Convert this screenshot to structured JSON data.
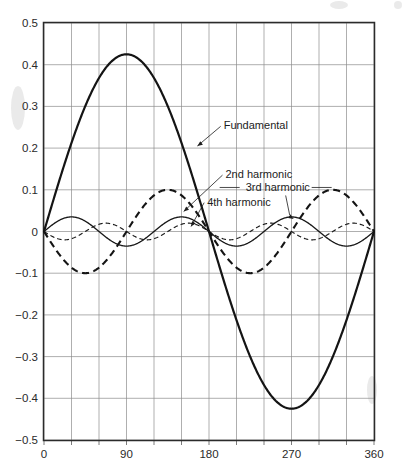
{
  "chart_data": {
    "type": "line",
    "title": "",
    "subtitle": "",
    "xlabel": "",
    "ylabel": "",
    "xlim": [
      0,
      360
    ],
    "ylim": [
      -0.5,
      0.5
    ],
    "x_ticks": [
      0,
      90,
      180,
      270,
      360
    ],
    "x_tick_labels": [
      "0",
      "90",
      "180",
      "270",
      "360"
    ],
    "x_gridlines": [
      0,
      30,
      60,
      90,
      120,
      150,
      180,
      210,
      240,
      270,
      300,
      330,
      360
    ],
    "y_ticks": [
      -0.5,
      -0.4,
      -0.3,
      -0.2,
      -0.1,
      0,
      0.1,
      0.2,
      0.3,
      0.4,
      0.5
    ],
    "y_tick_labels": [
      "-0.5",
      "-0.4",
      "-0.3",
      "-0.2",
      "-0.1",
      "0",
      "0.1",
      "0.2",
      "0.3",
      "0.4",
      "0.5"
    ],
    "grid": true,
    "legend_position": "inline-annotations",
    "series": [
      {
        "name": "Fundamental",
        "style": "solid-heavy",
        "amplitude": 0.425,
        "cycles": 1,
        "phase_deg": 0,
        "sign": 1,
        "peak_value": 0.425,
        "peak_at_deg": 90,
        "trough_value": -0.425,
        "trough_at_deg": 270
      },
      {
        "name": "2nd harmonic",
        "style": "dashed-heavy",
        "amplitude": 0.1,
        "cycles": 2,
        "phase_deg": 0,
        "sign": -1,
        "peak_value": 0.1,
        "peak_at_deg": 135,
        "trough_value": -0.1,
        "trough_at_deg": 45
      },
      {
        "name": "3rd harmonic",
        "style": "solid-thin",
        "amplitude": 0.035,
        "cycles": 3,
        "phase_deg": 0,
        "sign": 1,
        "peak_value": 0.035,
        "peak_at_deg": 30,
        "trough_value": -0.035,
        "trough_at_deg": 90
      },
      {
        "name": "4th harmonic",
        "style": "dashed-thin",
        "amplitude": 0.02,
        "cycles": 4,
        "phase_deg": 0,
        "sign": -1,
        "peak_value": 0.02,
        "peak_at_deg": 67.5,
        "trough_value": -0.02,
        "trough_at_deg": 22.5
      }
    ],
    "annotations": [
      {
        "text": "Fundamental",
        "label_x_deg": 196,
        "label_y_val": 0.245,
        "target_x_deg": 163,
        "target_y_val": 0.205
      },
      {
        "text": "2nd harmonic",
        "label_x_deg": 198,
        "label_y_val": 0.128,
        "target_x_deg": 148,
        "target_y_val": 0.048
      },
      {
        "text": "3rd harmonic",
        "label_x_deg": 220,
        "label_y_val": 0.096,
        "target_x_deg": 268,
        "target_y_val": 0.03
      },
      {
        "text": "4th harmonic",
        "label_x_deg": 178,
        "label_y_val": 0.062,
        "target_x_deg": 156,
        "target_y_val": 0.012
      }
    ]
  }
}
